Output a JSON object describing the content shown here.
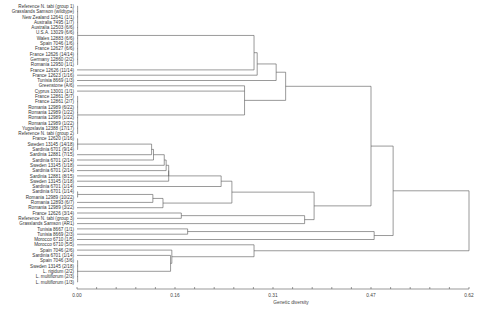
{
  "chart_data": {
    "type": "dendrogram",
    "title": "",
    "xlabel": "Genetic diversity",
    "ylabel": "",
    "x_ticks": [
      "0.00",
      "0.16",
      "0.31",
      "0.47",
      "0.62"
    ],
    "x_tick_values": [
      0.0,
      0.155,
      0.31,
      0.465,
      0.62
    ],
    "xlim": [
      0.0,
      0.62
    ],
    "grid": false,
    "minor_ticks": 20,
    "leaves": [
      "Reference N. tabi (group 1)",
      "Grasslands Samson (wildtype)",
      "New Zealand 12641 (1/1)",
      "Australia 7495 (1/7)",
      "Australia 12503 (6/6)",
      "U.S.A. 13029 (6/6)",
      "Wales 12883 (6/6)",
      "Spain 7046 (1/6)",
      "France 12627 (6/6)",
      "France 12626 (14/14)",
      "Germany 12860 (2/2)",
      "Romania 12950 (1/1)",
      "France 12626 (11/14)",
      "France 12623 (1/16)",
      "Tunisia 8669 (1/3)",
      "Greenstone (A/6)",
      "Cyprus 13001 (1/1)",
      "France 12861 (5/7)",
      "France 12861 (2/7)",
      "Romania 12989 (6/22)",
      "Romania 12989 (1/22)",
      "Romania 12989 (1/22)",
      "Romania 12989 (1/22)",
      "Yugoslavia 12388 (17/17)",
      "Reference N. tabi (group 2)",
      "France 12620 (1/16)",
      "Sweden 13145 (14/18)",
      "Sardinia 6701 (9/14)",
      "Sardinia 12881 (7/15)",
      "Sardinia 6701 (2/14)",
      "Sweden 13145 (1/18)",
      "Sardinia 6701 (2/14)",
      "Sardinia 12881 (8/15)",
      "Sweden 13145 (1/18)",
      "Sardinia 6701 (1/14)",
      "Sardinia 6701 (1/14)",
      "Romania 12989 (10/22)",
      "Romania 12893 (6/7)",
      "Romania 12989 (3/22)",
      "France 12626 (3/14)",
      "Reference N. tabi (group 3)",
      "Grasslands Samson (AR1)",
      "Tunisia 8667 (1/1)",
      "Tunisia 8669 (2/3)",
      "Morocco 6710 (1/5)",
      "Morocco 6710 (5/5)",
      "Spain 7046 (2/6)",
      "Sardinia 6701 (1/14)",
      "Spain 7046 (3/6)",
      "Sweden 13145 (2/18)",
      "L. rigidum (2/2)",
      "L. multiflorum (2/3)",
      "L. multiflorum (1/3)"
    ],
    "merges_approx": [
      {
        "group": "top cluster (rows 1-12)",
        "height": 0.0
      },
      {
        "group": "top cluster + France 12626 (11/14)",
        "height": 0.28
      },
      {
        "group": "+ France 12623 (1/16)",
        "height": 0.285
      },
      {
        "group": "+ Tunisia 8669 (1/3)",
        "height": 0.31
      },
      {
        "group": "France/Romania/Yugoslavia cluster",
        "height": 0.0
      },
      {
        "group": "France/Romania cluster + Greenstone/Cyprus",
        "height": 0.275
      },
      {
        "group": "upper clade",
        "height": 0.33
      },
      {
        "group": "Sweden/Sardinia subclade",
        "height": 0.12
      },
      {
        "group": "Sardinia cascade",
        "height": 0.14
      },
      {
        "group": "Romania 12989/12893 subclade",
        "height": 0.12
      },
      {
        "group": "Sardinia/Sweden + Romania",
        "height": 0.22
      },
      {
        "group": "France 12626 (3/14) + Reference group 3",
        "height": 0.165
      },
      {
        "group": "middle clade",
        "height": 0.37
      },
      {
        "group": "Tunisia 8667 + Tunisia 8669",
        "height": 0.17
      },
      {
        "group": "upper + middle",
        "height": 0.47
      },
      {
        "group": "lower L. rigidum/multiflorum clade",
        "height": 0.15
      },
      {
        "group": "Spain/Sardinia lower + Morocco",
        "height": 0.35
      },
      {
        "group": "root",
        "height": 0.62
      }
    ]
  }
}
